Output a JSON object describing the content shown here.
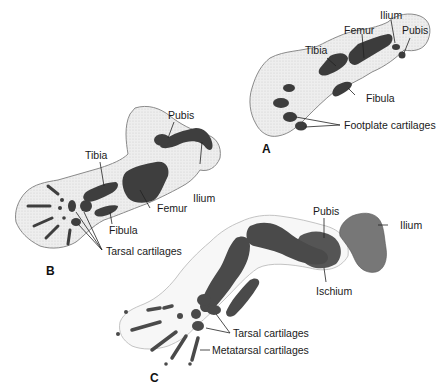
{
  "figure": {
    "panels": [
      {
        "id": "A",
        "letter": "A",
        "labels": {
          "ilium": "Ilium",
          "pubis": "Pubis",
          "femur": "Femur",
          "tibia": "Tibia",
          "fibula": "Fibula",
          "footplate": "Footplate cartilages"
        }
      },
      {
        "id": "B",
        "letter": "B",
        "labels": {
          "pubis": "Pubis",
          "tibia": "Tibia",
          "ilium": "Ilium",
          "femur": "Femur",
          "fibula": "Fibula",
          "tarsal": "Tarsal cartilages"
        }
      },
      {
        "id": "C",
        "letter": "C",
        "labels": {
          "pubis": "Pubis",
          "ilium": "Ilium",
          "ischium": "Ischium",
          "tarsal": "Tarsal cartilages",
          "metatarsal": "Metatarsal cartilages"
        }
      }
    ],
    "colors": {
      "cartilage": "#4a4a4a",
      "mesenchyme": "#ececec",
      "outline": "#8a8a8a",
      "bone_c": "#6e6e6e"
    }
  }
}
